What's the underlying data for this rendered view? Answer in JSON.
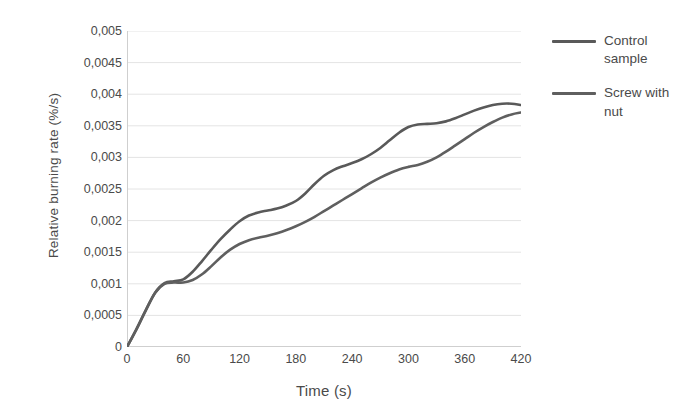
{
  "chart_data": {
    "type": "line",
    "title": "",
    "xlabel": "Time (s)",
    "ylabel": "Relative burning rate (%/s)",
    "xlim": [
      0,
      420
    ],
    "ylim": [
      0,
      0.005
    ],
    "grid": true,
    "legend_position": "right",
    "decimal_separator": ",",
    "x_ticks": [
      0,
      60,
      120,
      180,
      240,
      300,
      360,
      420
    ],
    "x_tick_labels": [
      "0",
      "60",
      "120",
      "180",
      "240",
      "300",
      "360",
      "420"
    ],
    "y_ticks": [
      0,
      0.0005,
      0.001,
      0.0015,
      0.002,
      0.0025,
      0.003,
      0.0035,
      0.004,
      0.0045,
      0.005
    ],
    "y_tick_labels": [
      "0",
      "0,0005",
      "0,001",
      "0,0015",
      "0,002",
      "0,0025",
      "0,003",
      "0,0035",
      "0,004",
      "0,0045",
      "0,005"
    ],
    "series": [
      {
        "name": "Control sample",
        "color": "#595959",
        "x": [
          0,
          10,
          20,
          30,
          40,
          50,
          60,
          70,
          80,
          90,
          100,
          110,
          120,
          130,
          140,
          150,
          160,
          170,
          180,
          190,
          200,
          210,
          220,
          230,
          240,
          250,
          260,
          270,
          280,
          290,
          300,
          310,
          320,
          330,
          340,
          350,
          360,
          370,
          380,
          390,
          400,
          410,
          420
        ],
        "values": [
          0,
          0.00028,
          0.00058,
          0.00086,
          0.00101,
          0.00104,
          0.00107,
          0.00119,
          0.00136,
          0.00154,
          0.00171,
          0.00186,
          0.00199,
          0.00208,
          0.00213,
          0.00216,
          0.00219,
          0.00224,
          0.00231,
          0.00243,
          0.00258,
          0.00271,
          0.0028,
          0.00286,
          0.00291,
          0.00297,
          0.00305,
          0.00315,
          0.00327,
          0.00339,
          0.00348,
          0.00352,
          0.00353,
          0.00354,
          0.00357,
          0.00362,
          0.00368,
          0.00374,
          0.00379,
          0.00383,
          0.00385,
          0.00385,
          0.00383
        ]
      },
      {
        "name": "Screw with nut",
        "color": "#5f5f5f",
        "x": [
          0,
          10,
          20,
          30,
          40,
          50,
          60,
          70,
          80,
          90,
          100,
          110,
          120,
          130,
          140,
          150,
          160,
          170,
          180,
          190,
          200,
          210,
          220,
          230,
          240,
          250,
          260,
          270,
          280,
          290,
          300,
          310,
          320,
          330,
          340,
          350,
          360,
          370,
          380,
          390,
          400,
          410,
          420
        ],
        "values": [
          0,
          0.00028,
          0.00058,
          0.00086,
          0.001,
          0.00102,
          0.00102,
          0.00106,
          0.00115,
          0.00128,
          0.00142,
          0.00154,
          0.00163,
          0.00169,
          0.00173,
          0.00176,
          0.0018,
          0.00185,
          0.00191,
          0.00198,
          0.00206,
          0.00215,
          0.00224,
          0.00233,
          0.00242,
          0.00251,
          0.0026,
          0.00268,
          0.00275,
          0.00281,
          0.00285,
          0.00288,
          0.00293,
          0.003,
          0.00309,
          0.00319,
          0.00329,
          0.00339,
          0.00348,
          0.00356,
          0.00363,
          0.00368,
          0.00371
        ]
      }
    ]
  },
  "legend": {
    "items": [
      {
        "label": "Control sample"
      },
      {
        "label": "Screw with nut"
      }
    ]
  },
  "colors": {
    "series_1": "#595959",
    "series_2": "#5f5f5f",
    "grid": "#e4e4e4",
    "axis": "#cfcfcf",
    "text": "#4a4a4a"
  }
}
